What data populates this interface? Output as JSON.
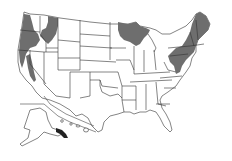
{
  "map": {
    "title": "",
    "region": "United States",
    "type": "choropleth-presence",
    "colors": {
      "background": "#ffffff",
      "state_fill": "#ffffff",
      "state_border": "#333333",
      "highlight_fill": "#6e6e6e",
      "dark_highlight": "#222222"
    },
    "highlighted_regions": [
      "Western Washington",
      "Western Oregon",
      "Northern California coast",
      "California Sierra Nevada",
      "Northern Idaho",
      "Western Montana",
      "Northern Minnesota",
      "Northern Wisconsin",
      "Upper Peninsula of Michigan",
      "Maine",
      "New Hampshire",
      "Vermont",
      "Massachusetts",
      "Rhode Island",
      "Connecticut",
      "New York",
      "Pennsylvania",
      "New Jersey",
      "Maryland (western)",
      "West Virginia (eastern)",
      "Southeast Alaska"
    ],
    "insets": [
      "Alaska",
      "Hawaii"
    ]
  }
}
